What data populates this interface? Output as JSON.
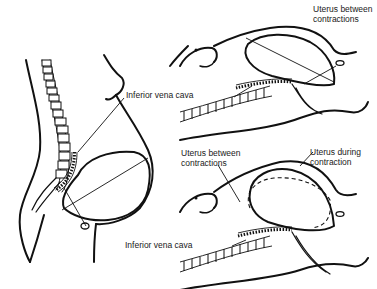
{
  "figure": {
    "panels": [
      {
        "id": "standing",
        "labels": {
          "ivc": "Inferior vena cava"
        }
      },
      {
        "id": "supine-between",
        "labels": {
          "uterus": "Uterus between\ncontractions"
        }
      },
      {
        "id": "supine-during",
        "labels": {
          "uterus_between": "Uterus between\ncontractions",
          "uterus_during": "Uterus during\ncontraction",
          "ivc": "Inferior vena cava"
        }
      }
    ]
  },
  "colors": {
    "line": "#111111",
    "background": "#ffffff",
    "text": "#1a1a1a"
  }
}
